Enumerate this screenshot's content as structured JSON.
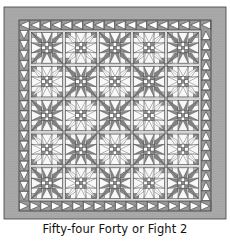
{
  "caption": "Fifty-four Forty or Fight 2",
  "quilt": {
    "pattern_name": "Fifty-four Forty or Fight",
    "block_rows": 5,
    "block_cols": 5,
    "block_layout": [
      [
        "dark",
        "light",
        "dark",
        "light",
        "dark"
      ],
      [
        "light",
        "dark",
        "light",
        "dark",
        "light"
      ],
      [
        "dark",
        "light",
        "dark",
        "light",
        "dark"
      ],
      [
        "light",
        "dark",
        "light",
        "dark",
        "light"
      ],
      [
        "dark",
        "light",
        "dark",
        "light",
        "dark"
      ]
    ],
    "triangle_border": {
      "top_count": 18,
      "bottom_count": 18,
      "left_count": 17,
      "right_count": 17,
      "top_direction": "left",
      "bottom_direction": "right",
      "left_direction": "down",
      "right_direction": "up"
    },
    "colors": {
      "outer_border": "#a9a9a9",
      "outer_border_stripe": "#9c9c9c",
      "triangle_bg": "#9a9a9a",
      "triangle_fill": "#ffffff",
      "sashing": "#e4e4e4",
      "cornerstone": "#9e9e9e",
      "block_bg": "#f8f8f8",
      "dark_fabric": "#8a8a8a",
      "mid_fabric": "#b5b5b5",
      "light_fabric": "#ffffff",
      "outline": "#3c3c3c"
    }
  }
}
